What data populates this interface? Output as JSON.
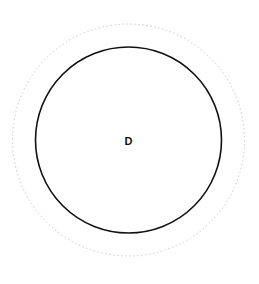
{
  "diagram": {
    "node_label": "D",
    "inner_circle": {
      "cx": 128.5,
      "cy": 140,
      "r": 93,
      "stroke": "#111111",
      "stroke_width": 1.6
    },
    "outer_circle": {
      "cx": 128.5,
      "cy": 140,
      "r": 116,
      "stroke": "#c8c8c8",
      "style": "dotted"
    }
  }
}
